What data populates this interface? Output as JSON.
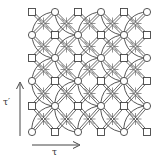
{
  "diagram": {
    "type": "lattice",
    "columns_x": [
      32,
      55,
      78,
      101,
      124,
      147
    ],
    "rows_y": [
      12,
      35,
      58,
      81,
      106,
      132
    ],
    "node_types_first_row": [
      "square",
      "circle",
      "square",
      "circle",
      "square",
      "circle"
    ],
    "node_pattern": "checkerboard",
    "colors": {
      "stroke": "#444444",
      "background": "#ffffff"
    }
  },
  "axes": {
    "vertical_label": "τ′",
    "horizontal_label": "τ"
  }
}
